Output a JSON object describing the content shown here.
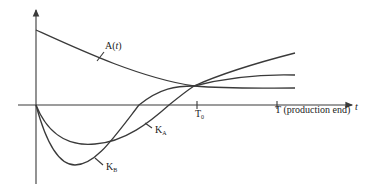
{
  "diagram": {
    "curves": [
      {
        "id": "A",
        "label": "A(t)",
        "label_base": "A(",
        "label_var": "t",
        "label_close": ")"
      },
      {
        "id": "KA",
        "label_base": "K",
        "label_sub": "A"
      },
      {
        "id": "KB",
        "label_base": "K",
        "label_sub": "B"
      }
    ],
    "x_axis": {
      "label": "t",
      "ticks": [
        {
          "base": "T",
          "sub": "0"
        },
        {
          "base": "T",
          "text": " (production end)"
        }
      ]
    },
    "colors": {
      "stroke": "#3a3a3a",
      "background": "#ffffff"
    }
  }
}
